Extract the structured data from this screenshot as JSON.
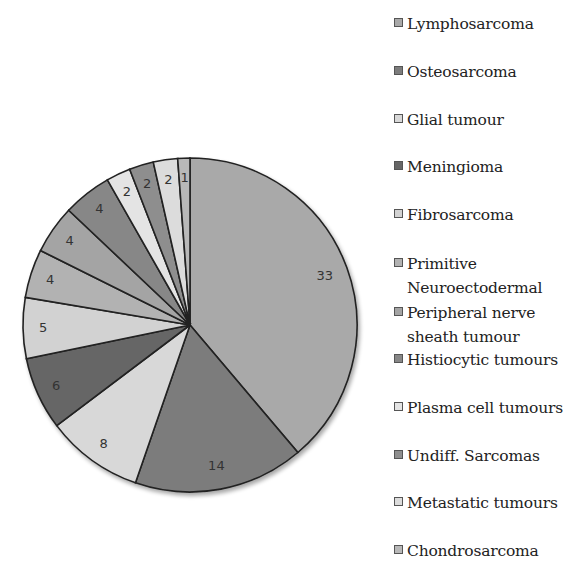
{
  "chart_data": {
    "type": "pie",
    "title": "",
    "start_angle_deg": -90,
    "direction": "clockwise",
    "categories": [
      "Lymphosarcoma",
      "Osteosarcoma",
      "Glial tumour",
      "Meningioma",
      "Fibrosarcoma",
      "Primitive Neuroectodermal",
      "Peripheral nerve sheath tumour",
      "Histiocytic tumours",
      "Plasma cell tumours",
      "Undiff. Sarcomas",
      "Metastatic tumours",
      "Chondrosarcoma"
    ],
    "values": [
      33,
      14,
      8,
      6,
      5,
      4,
      4,
      4,
      2,
      2,
      2,
      1
    ],
    "colors": [
      "#a9a9a9",
      "#7c7c7c",
      "#d8d8d8",
      "#666666",
      "#d2d2d2",
      "#b2b2b2",
      "#a4a4a4",
      "#878787",
      "#e4e4e4",
      "#8e8e8e",
      "#dcdcdc",
      "#b8b8b8"
    ],
    "data_labels_shown": true,
    "legend_position": "right"
  },
  "legend": {
    "items": [
      {
        "label": "Lymphosarcoma",
        "top": 12
      },
      {
        "label": "Osteosarcoma",
        "top": 60
      },
      {
        "label": "Glial tumour",
        "top": 108
      },
      {
        "label": "Meningioma",
        "top": 155
      },
      {
        "label": "Fibrosarcoma",
        "top": 203
      },
      {
        "label": "Primitive\nNeuroectodermal",
        "top": 252
      },
      {
        "label": "Peripheral nerve\nsheath tumour",
        "top": 301
      },
      {
        "label": "Histiocytic tumours",
        "top": 348
      },
      {
        "label": "Plasma cell tumours",
        "top": 396
      },
      {
        "label": "Undiff. Sarcomas",
        "top": 444
      },
      {
        "label": "Metastatic tumours",
        "top": 491
      },
      {
        "label": "Chondrosarcoma",
        "top": 539
      }
    ]
  },
  "pie": {
    "cx": 190,
    "cy": 325,
    "r": 167
  }
}
